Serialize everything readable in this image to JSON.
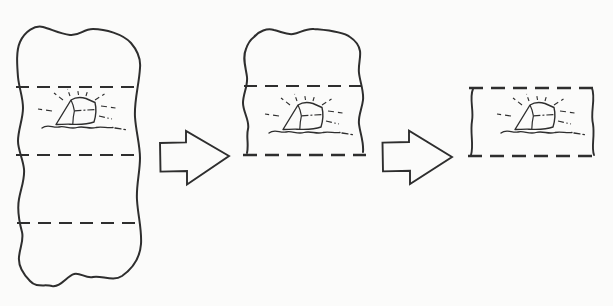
{
  "page": {
    "background_color": "#fbfbfa",
    "ink_color": "#2e2e2e"
  },
  "diagram": {
    "kind": "three-stage-trimming-sequence",
    "stages": [
      {
        "name": "stage-1",
        "icon": "large-irregular-block-with-shining-crystal",
        "dashed_section_lines": 3
      },
      {
        "name": "stage-2",
        "icon": "trimmed-block-with-shining-crystal",
        "dashed_section_lines": 1,
        "dashed_bottom_edge": true
      },
      {
        "name": "stage-3",
        "icon": "final-section-with-shining-crystal",
        "dashed_section_lines": 0,
        "dashed_top_and_bottom_edges": true
      }
    ],
    "connectors": [
      {
        "name": "arrow-1",
        "icon": "block-arrow-right"
      },
      {
        "name": "arrow-2",
        "icon": "block-arrow-right"
      }
    ]
  }
}
